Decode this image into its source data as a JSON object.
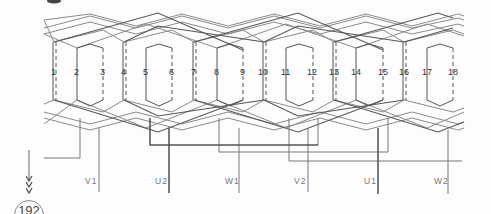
{
  "figure": {
    "type": "winding-diagram",
    "slots": [
      {
        "n": "1",
        "x": 54,
        "style": "double"
      },
      {
        "n": "2",
        "x": 77,
        "style": "solid"
      },
      {
        "n": "3",
        "x": 103,
        "style": "dashed"
      },
      {
        "n": "4",
        "x": 124,
        "style": "double"
      },
      {
        "n": "5",
        "x": 146,
        "style": "solid"
      },
      {
        "n": "6",
        "x": 172,
        "style": "dashed"
      },
      {
        "n": "7",
        "x": 194,
        "style": "double"
      },
      {
        "n": "8",
        "x": 217,
        "style": "solid"
      },
      {
        "n": "9",
        "x": 243,
        "style": "dashed"
      },
      {
        "n": "10",
        "x": 264,
        "style": "double"
      },
      {
        "n": "11",
        "x": 286,
        "style": "solid"
      },
      {
        "n": "12",
        "x": 313,
        "style": "dashed"
      },
      {
        "n": "13",
        "x": 334,
        "style": "double"
      },
      {
        "n": "14",
        "x": 356,
        "style": "solid"
      },
      {
        "n": "15",
        "x": 383,
        "style": "dashed"
      },
      {
        "n": "16",
        "x": 404,
        "style": "double"
      },
      {
        "n": "17",
        "x": 427,
        "style": "solid"
      },
      {
        "n": "18",
        "x": 453,
        "style": "dashed"
      }
    ],
    "terminals": [
      {
        "label": "V1",
        "x": 99
      },
      {
        "label": "U2",
        "x": 169
      },
      {
        "label": "W1",
        "x": 239
      },
      {
        "label": "V2",
        "x": 308
      },
      {
        "label": "U1",
        "x": 378
      },
      {
        "label": "W2",
        "x": 448
      }
    ]
  },
  "page": {
    "number": "192"
  },
  "colors": {
    "line": "#555555",
    "light_line": "#8a8a8a",
    "text": "#333333"
  }
}
